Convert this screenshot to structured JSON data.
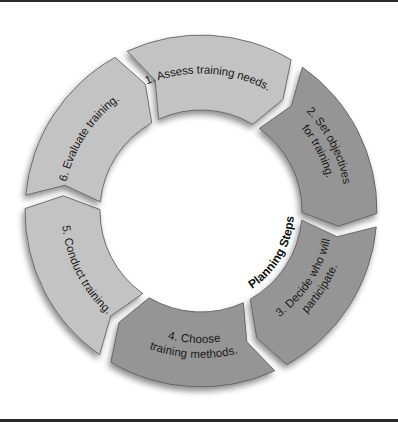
{
  "diagram": {
    "title": "Planning Steps",
    "type": "cycle",
    "center": {
      "x": 201,
      "y": 211
    },
    "outer_radius": 176,
    "inner_radius": 101,
    "colors": {
      "light_segment": "#c3c3c3",
      "dark_segment": "#959595",
      "outline": "#555555",
      "text": "#1a1a1a",
      "background": "#ffffff",
      "frame": "#2a2a2a"
    },
    "steps": [
      {
        "number": 1,
        "lines": [
          "1. Assess training needs."
        ],
        "shade": "light",
        "start_angle": 243,
        "end_angle": 303
      },
      {
        "number": 2,
        "lines": [
          "2. Set objectives",
          "for training."
        ],
        "shade": "dark",
        "start_angle": 303,
        "end_angle": 363
      },
      {
        "number": 3,
        "lines": [
          "3. Decide who will",
          "participate."
        ],
        "shade": "dark",
        "start_angle": 3,
        "end_angle": 63
      },
      {
        "number": 4,
        "lines": [
          "4. Choose",
          "training methods."
        ],
        "shade": "dark",
        "start_angle": 63,
        "end_angle": 123
      },
      {
        "number": 5,
        "lines": [
          "5. Conduct training."
        ],
        "shade": "light",
        "start_angle": 123,
        "end_angle": 183
      },
      {
        "number": 6,
        "lines": [
          "6. Evaluate training."
        ],
        "shade": "light",
        "start_angle": 183,
        "end_angle": 243
      }
    ]
  }
}
